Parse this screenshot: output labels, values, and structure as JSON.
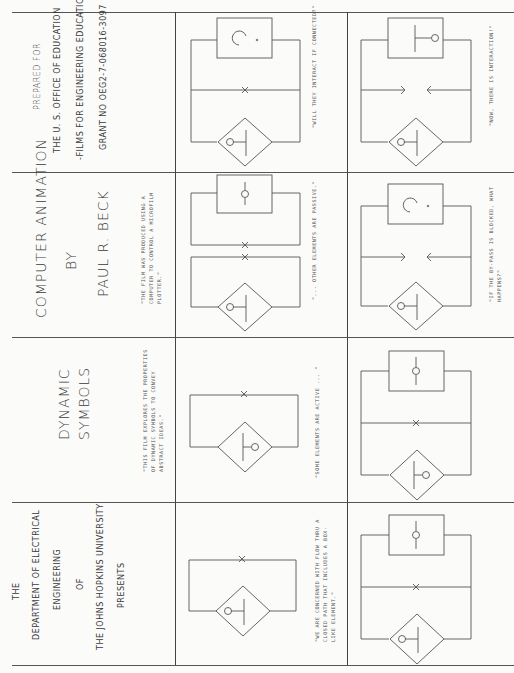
{
  "document": {
    "type": "storyboard",
    "orientation": "rotated-90",
    "rows": [
      {
        "title_block": {
          "lines": [
            "PREPARED FOR",
            "THE U. S. OFFICE OF EDUCATION",
            "-FILMS FOR ENGINEERING EDUCATION-",
            "GRANT NO OEG2-7-068016-3097"
          ]
        },
        "frame_1": {
          "diagram": "box-question, middle-x, diamond-circle-bar",
          "caption": "\"WILL THEY INTERACT IF CONNECTED?\""
        },
        "frame_2": {
          "diagram": "box-bar-circle, arrows-facing, diamond-circle-bar",
          "caption": "\"NOW, THERE IS INTERACTION!\""
        }
      },
      {
        "title_block": {
          "lines": [
            "COMPUTER ANIMATION",
            "BY",
            "PAUL R. BECK"
          ],
          "caption": "\"THE FILM WAS PRODUCED USING A\nCOMPUTER TO CONTROL A MICROFILM\nPLOTTER.\""
        },
        "frame_1": {
          "diagram": "box-circle, double-x split loop, diamond-circle-bar",
          "caption": "\"... OTHER ELEMENTS ARE PASSIVE.\""
        },
        "frame_2": {
          "diagram": "box-question, arrows-facing, diamond-circle-bar",
          "caption": "\"IF THE BY-PASS IS BLOCKED, WHAT\nHAPPENS?\""
        }
      },
      {
        "title_block": {
          "lines": [
            "DYNAMIC",
            "SYMBOLS"
          ],
          "caption": "\"THIS FILM EXPLORES THE PROPERTIES\nOF DYNAMIC SYMBOLS TO CONVEY\nABSTRACT IDEAS.\""
        },
        "frame_1": {
          "diagram": "x loop, diamond-bar-circle",
          "caption": "\"SOME ELEMENTS ARE ACTIVE ... \""
        },
        "frame_2": {
          "diagram": "box-circle, middle-x, diamond-bar-circle",
          "caption": ""
        }
      },
      {
        "title_block": {
          "lines": [
            "THE",
            "DEPARTMENT OF ELECTRICAL",
            "ENGINEERING",
            "OF",
            "THE JOHNS HOPKINS UNIVERSITY",
            "PRESENTS"
          ]
        },
        "frame_1": {
          "diagram": "x loop, diamond-circle-bar",
          "caption": "\"WE ARE CONCERNED WITH FLOW THRU A\nCLOSED PATH THAT INCLUDES A BOX-\nLIKE ELEMENT.\""
        },
        "frame_2": {
          "diagram": "box-circle, middle-x, diamond-circle-bar",
          "caption": ""
        }
      }
    ]
  }
}
